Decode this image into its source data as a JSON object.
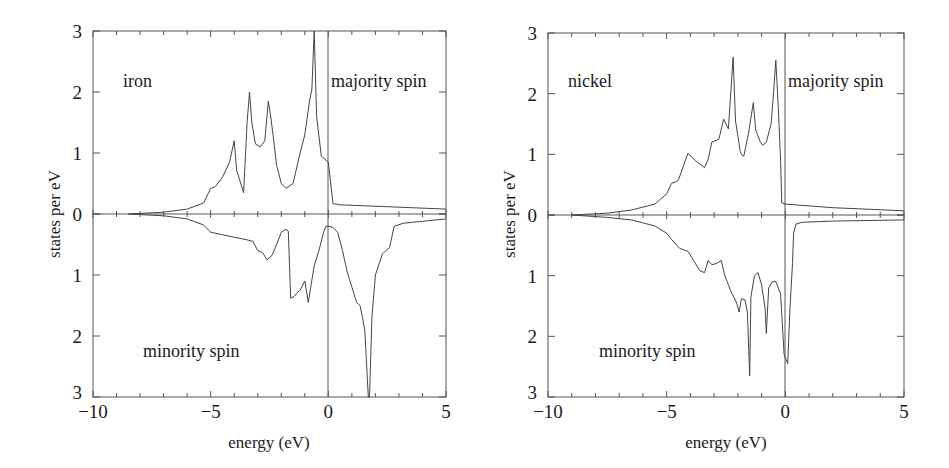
{
  "chart_data": [
    {
      "type": "line",
      "title": "iron",
      "xlabel": "energy (eV)",
      "ylabel": "states per eV",
      "xlim": [
        -10,
        5
      ],
      "ylim_majority": [
        0,
        3
      ],
      "ylim_minority": [
        0,
        3
      ],
      "x_ticks": [
        "-10",
        "-5",
        "0",
        "5"
      ],
      "y_ticks_upper": [
        "3",
        "2",
        "1",
        "0"
      ],
      "y_ticks_lower": [
        "1",
        "2",
        "3"
      ],
      "annotations": [
        "iron",
        "majority spin",
        "minority spin"
      ],
      "fermi_level": 0,
      "grid": false,
      "series": [
        {
          "name": "majority spin",
          "x": [
            -8.5,
            -7,
            -6,
            -5.3,
            -5.0,
            -4.8,
            -4.5,
            -4.2,
            -4.0,
            -3.9,
            -3.8,
            -3.6,
            -3.45,
            -3.35,
            -3.25,
            -3.1,
            -2.9,
            -2.7,
            -2.55,
            -2.45,
            -2.35,
            -2.2,
            -2.0,
            -1.8,
            -1.5,
            -1.2,
            -1.0,
            -0.8,
            -0.7,
            -0.6,
            -0.5,
            -0.3,
            0.0,
            0.2,
            0.5,
            5.0
          ],
          "values": [
            0.0,
            0.03,
            0.08,
            0.18,
            0.42,
            0.45,
            0.6,
            0.85,
            1.2,
            0.72,
            0.6,
            0.35,
            1.5,
            2.0,
            1.5,
            1.15,
            1.1,
            1.2,
            1.85,
            1.6,
            1.3,
            0.8,
            0.5,
            0.42,
            0.5,
            1.0,
            1.3,
            1.85,
            2.05,
            3.0,
            1.6,
            0.95,
            0.85,
            0.17,
            0.15,
            0.08
          ]
        },
        {
          "name": "minority spin",
          "x": [
            -8.5,
            -7,
            -6,
            -5.3,
            -5.0,
            -4.5,
            -4.0,
            -3.5,
            -3.2,
            -3.0,
            -2.8,
            -2.6,
            -2.4,
            -2.2,
            -2.0,
            -1.8,
            -1.7,
            -1.6,
            -1.45,
            -1.35,
            -1.2,
            -1.0,
            -0.85,
            -0.75,
            -0.6,
            -0.4,
            -0.2,
            -0.1,
            0.0,
            0.2,
            0.4,
            0.6,
            0.8,
            1.0,
            1.2,
            1.35,
            1.45,
            1.55,
            1.7,
            1.75,
            1.85,
            2.0,
            2.3,
            2.6,
            2.8,
            3.2,
            4.0,
            5.0
          ],
          "values": [
            0.0,
            0.03,
            0.08,
            0.18,
            0.3,
            0.34,
            0.38,
            0.42,
            0.45,
            0.6,
            0.63,
            0.75,
            0.68,
            0.5,
            0.3,
            0.25,
            0.28,
            1.38,
            1.35,
            1.3,
            1.25,
            1.1,
            1.45,
            1.2,
            0.85,
            0.6,
            0.3,
            0.2,
            0.2,
            0.22,
            0.3,
            0.6,
            0.95,
            1.2,
            1.45,
            1.5,
            1.7,
            1.9,
            3.0,
            3.0,
            1.7,
            1.0,
            0.65,
            0.55,
            0.2,
            0.15,
            0.12,
            0.08
          ]
        }
      ]
    },
    {
      "type": "line",
      "title": "nickel",
      "xlabel": "energy (eV)",
      "ylabel": "states per eV",
      "xlim": [
        -10,
        5
      ],
      "ylim_majority": [
        0,
        3
      ],
      "ylim_minority": [
        0,
        3
      ],
      "x_ticks": [
        "-10",
        "-5",
        "0",
        "5"
      ],
      "y_ticks_upper": [
        "3",
        "2",
        "1",
        "0"
      ],
      "y_ticks_lower": [
        "1",
        "2",
        "3"
      ],
      "annotations": [
        "nickel",
        "majority spin",
        "minority spin"
      ],
      "fermi_level": 0,
      "grid": false,
      "series": [
        {
          "name": "majority spin",
          "x": [
            -9.0,
            -7.5,
            -6.5,
            -5.5,
            -5.0,
            -4.8,
            -4.6,
            -4.5,
            -4.1,
            -3.8,
            -3.4,
            -3.25,
            -3.1,
            -2.8,
            -2.6,
            -2.4,
            -2.2,
            -2.1,
            -2.0,
            -1.9,
            -1.85,
            -1.75,
            -1.55,
            -1.35,
            -1.25,
            -1.15,
            -1.05,
            -0.95,
            -0.8,
            -0.6,
            -0.5,
            -0.4,
            -0.3,
            -0.2,
            -0.15,
            0.0,
            2.0,
            5.0
          ],
          "values": [
            0.0,
            0.03,
            0.08,
            0.18,
            0.35,
            0.52,
            0.55,
            0.58,
            1.02,
            0.9,
            0.78,
            0.92,
            1.2,
            1.25,
            1.58,
            1.42,
            2.6,
            1.55,
            1.3,
            1.05,
            1.0,
            0.97,
            1.35,
            1.85,
            1.4,
            1.3,
            1.2,
            1.15,
            1.2,
            1.5,
            2.0,
            2.55,
            1.8,
            0.9,
            0.2,
            0.18,
            0.12,
            0.07
          ]
        },
        {
          "name": "minority spin",
          "x": [
            -9.0,
            -7.5,
            -6.5,
            -5.5,
            -5.0,
            -4.8,
            -4.45,
            -4.1,
            -3.6,
            -3.4,
            -3.25,
            -3.1,
            -2.9,
            -2.7,
            -2.55,
            -2.3,
            -2.05,
            -1.95,
            -1.85,
            -1.7,
            -1.6,
            -1.5,
            -1.45,
            -1.3,
            -1.15,
            -1.0,
            -0.85,
            -0.8,
            -0.7,
            -0.55,
            -0.4,
            -0.2,
            -0.05,
            0.1,
            0.2,
            0.3,
            0.35,
            0.45,
            0.7,
            2.0,
            5.0
          ],
          "values": [
            0.0,
            0.04,
            0.08,
            0.18,
            0.3,
            0.4,
            0.55,
            0.6,
            0.92,
            0.95,
            0.75,
            0.82,
            0.8,
            0.75,
            1.0,
            1.25,
            1.45,
            1.6,
            1.38,
            1.4,
            1.6,
            2.65,
            1.35,
            1.0,
            0.95,
            1.15,
            1.55,
            1.95,
            1.2,
            1.1,
            1.1,
            1.3,
            2.3,
            2.45,
            1.5,
            0.8,
            0.3,
            0.15,
            0.12,
            0.1,
            0.08
          ]
        }
      ]
    }
  ],
  "plots": [
    {
      "material_label": "iron",
      "majority_label": "majority spin",
      "minority_label": "minority spin",
      "xlabel": "energy (eV)",
      "ylabel": "states per eV",
      "x_tick_labels": [
        "−10",
        "−5",
        "0",
        "5"
      ],
      "y_tick_labels_upper": [
        "3",
        "2",
        "1",
        "0"
      ],
      "y_tick_labels_lower": [
        "1",
        "2",
        "3"
      ]
    },
    {
      "material_label": "nickel",
      "majority_label": "majority spin",
      "minority_label": "minority spin",
      "xlabel": "energy (eV)",
      "ylabel": "states per eV",
      "x_tick_labels": [
        "−10",
        "−5",
        "0",
        "5"
      ],
      "y_tick_labels_upper": [
        "3",
        "2",
        "1",
        "0"
      ],
      "y_tick_labels_lower": [
        "1",
        "2",
        "3"
      ]
    }
  ]
}
